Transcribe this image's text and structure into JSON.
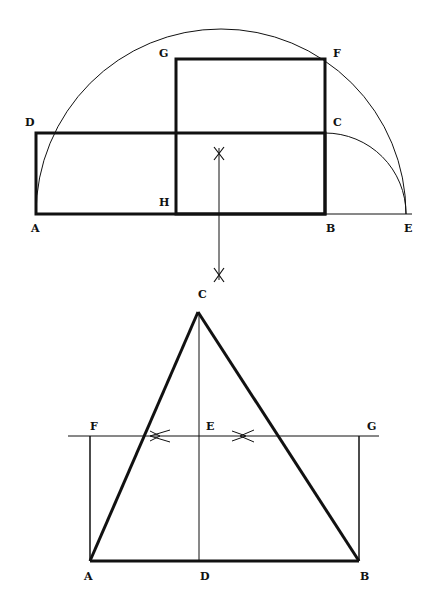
{
  "figures": [
    {
      "id": "golden-rectangle-construction",
      "labels": {
        "A": "A",
        "B": "B",
        "C": "C",
        "D": "D",
        "E": "E",
        "F": "F",
        "G": "G",
        "H": "H"
      }
    },
    {
      "id": "triangle-construction",
      "labels": {
        "A": "A",
        "B": "B",
        "C": "C",
        "D": "D",
        "E": "E",
        "F": "F",
        "G": "G"
      }
    }
  ],
  "colors": {
    "ink": "#111111",
    "background": "#ffffff"
  }
}
